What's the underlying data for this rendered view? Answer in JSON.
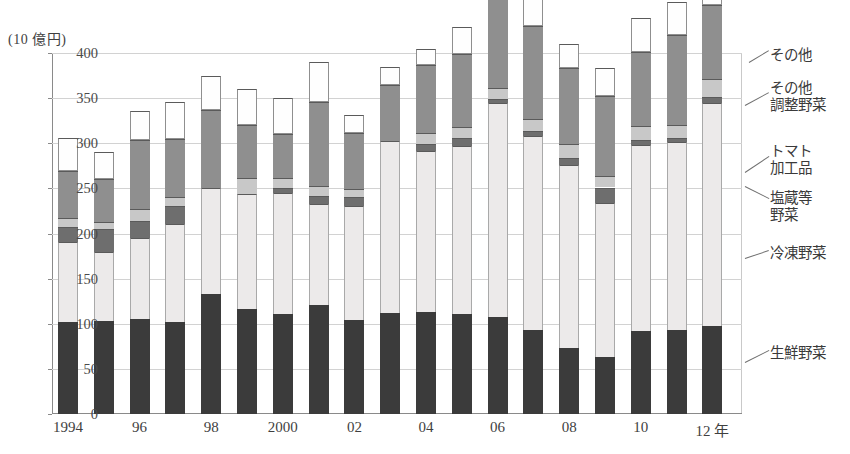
{
  "axis": {
    "y_unit_label": "(10 億円)",
    "y_ticks": [
      "400",
      "350",
      "300",
      "250",
      "200",
      "150",
      "100",
      "50",
      "0"
    ],
    "x_tick_labels": [
      "1994",
      "96",
      "98",
      "2000",
      "02",
      "04",
      "06",
      "08",
      "10",
      "12 年"
    ]
  },
  "legend": [
    {
      "key": "other",
      "label": "その他"
    },
    {
      "key": "prep",
      "label": "その他\n調整野菜"
    },
    {
      "key": "tomato",
      "label": "トマト\n加工品"
    },
    {
      "key": "salted",
      "label": "塩蔵等\n野菜"
    },
    {
      "key": "frozen",
      "label": "冷凍野菜"
    },
    {
      "key": "fresh",
      "label": "生鮮野菜"
    }
  ],
  "colors": {
    "fresh": "#3b3b3b",
    "frozen": "#eceaea",
    "salted": "#6e6e6e",
    "tomato": "#c8c8c8",
    "prep": "#8f8f8f",
    "other": "#fefefe",
    "axis": "#8a8a8a",
    "grid": "#d2d2d2"
  },
  "chart_data": {
    "type": "bar",
    "stacked": true,
    "title": "",
    "subtitle": "",
    "xlabel": "",
    "ylabel": "(10 億円)",
    "ylim": [
      0,
      400
    ],
    "ytick_step": 50,
    "grid": true,
    "legend_position": "right-outside-leader-lines",
    "categories": [
      "1994",
      "1995",
      "1996",
      "1997",
      "1998",
      "1999",
      "2000",
      "2001",
      "2002",
      "2003",
      "2004",
      "2005",
      "2006",
      "2007",
      "2008",
      "2009",
      "2010",
      "2011",
      "2012"
    ],
    "series": [
      {
        "name": "生鮮野菜",
        "key": "fresh",
        "values": [
          102,
          103,
          105,
          102,
          133,
          116,
          111,
          121,
          104,
          112,
          113,
          111,
          107,
          93,
          73,
          63,
          92,
          93,
          97
        ]
      },
      {
        "name": "冷凍野菜",
        "key": "frozen",
        "values": [
          89,
          77,
          90,
          109,
          117,
          128,
          134,
          112,
          126,
          191,
          178,
          186,
          238,
          215,
          203,
          171,
          206,
          208,
          248
        ]
      },
      {
        "name": "塩蔵等野菜",
        "key": "salted",
        "values": [
          16,
          25,
          19,
          20,
          0,
          0,
          5,
          9,
          10,
          0,
          8,
          9,
          4,
          6,
          8,
          17,
          6,
          5,
          6
        ]
      },
      {
        "name": "トマト加工品",
        "key": "tomato",
        "values": [
          10,
          8,
          13,
          10,
          0,
          17,
          12,
          11,
          9,
          0,
          12,
          12,
          12,
          13,
          15,
          13,
          15,
          14,
          20
        ]
      },
      {
        "name": "その他調整野菜",
        "key": "prep",
        "values": [
          52,
          47,
          77,
          64,
          87,
          59,
          48,
          93,
          62,
          62,
          76,
          81,
          100,
          103,
          84,
          88,
          82,
          100,
          82
        ]
      },
      {
        "name": "その他",
        "key": "other",
        "values": [
          37,
          30,
          32,
          41,
          38,
          40,
          40,
          44,
          20,
          20,
          18,
          30,
          35,
          42,
          27,
          31,
          38,
          37,
          40
        ]
      }
    ],
    "totals": [
      281,
      290,
      336,
      346,
      390,
      360,
      350,
      390,
      331,
      385,
      405,
      429,
      496,
      472,
      410,
      383,
      439,
      457,
      493
    ]
  }
}
